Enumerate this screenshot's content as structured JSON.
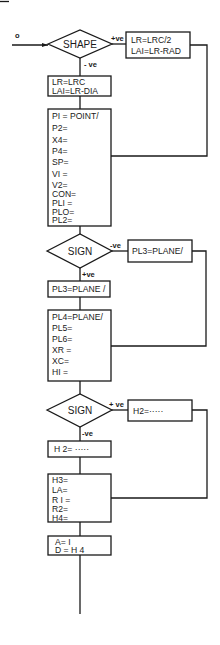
{
  "diagram": {
    "entry_label": "o",
    "decisions": [
      {
        "id": "d1",
        "label": "SHAPE",
        "yes_label": "+ve",
        "no_label": "- ve"
      },
      {
        "id": "d2",
        "label": "SIGN",
        "yes_label": "+ve",
        "no_label": "-ve"
      },
      {
        "id": "d3",
        "label": "SIGN",
        "yes_label": "+ ve",
        "no_label": "-ve"
      }
    ],
    "boxes": {
      "d1_yes": [
        "LR=LRC/2",
        "LAI=LR-RAD"
      ],
      "d1_no": [
        "LR=LRC",
        "LAI=LR-DIA"
      ],
      "block1": [
        "PI = POINT/",
        "P2=",
        "X4=",
        "P4=",
        "SP=",
        "VI =",
        "V2=",
        "CON=",
        "PLI =",
        "PLO=",
        "PL2="
      ],
      "d2_no": [
        "PL3=PLANE/"
      ],
      "d2_yes": [
        "PL3=PLANE /"
      ],
      "block2": [
        "PL4=PLANE/",
        "PL5=",
        "PL6=",
        "XR =",
        "XC=",
        "HI ="
      ],
      "d3_yes": [
        "H2=·····"
      ],
      "d3_no": [
        "H 2= ·····"
      ],
      "block3": [
        "H3=",
        "LA=",
        "R I =",
        "R2=",
        "H4="
      ],
      "block4": [
        "A= I",
        "D = H 4"
      ]
    }
  }
}
